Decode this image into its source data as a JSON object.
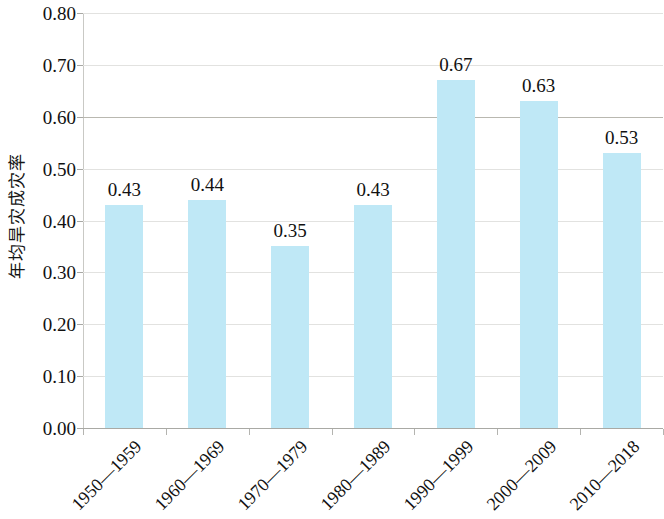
{
  "chart_data": {
    "type": "bar",
    "title": "",
    "subtitle": "",
    "xlabel": "",
    "ylabel": "年均旱灾成灾率",
    "categories": [
      "1950—1959",
      "1960—1969",
      "1970—1979",
      "1980—1989",
      "1990—1999",
      "2000—2009",
      "2010—2018"
    ],
    "values": [
      0.43,
      0.44,
      0.35,
      0.43,
      0.67,
      0.63,
      0.53
    ],
    "value_labels": [
      "0.43",
      "0.44",
      "0.35",
      "0.43",
      "0.67",
      "0.63",
      "0.53"
    ],
    "ylim": [
      0.0,
      0.8
    ],
    "ytick_values": [
      0.8,
      0.7,
      0.6,
      0.5,
      0.4,
      0.3,
      0.2,
      0.1,
      0.0
    ],
    "ytick_labels": [
      "0.80",
      "0.70",
      "0.60",
      "0.50",
      "0.40",
      "0.30",
      "0.20",
      "0.10",
      "0.00"
    ],
    "grid": true,
    "grid_axis": "y",
    "legend": false,
    "legend_position": "none",
    "bar_color": "#bfe8f6",
    "grid_color": "#e2e2e0",
    "axis_color": "#a9a9a4",
    "text_color": "#111111",
    "background_color": "#ffffff"
  }
}
